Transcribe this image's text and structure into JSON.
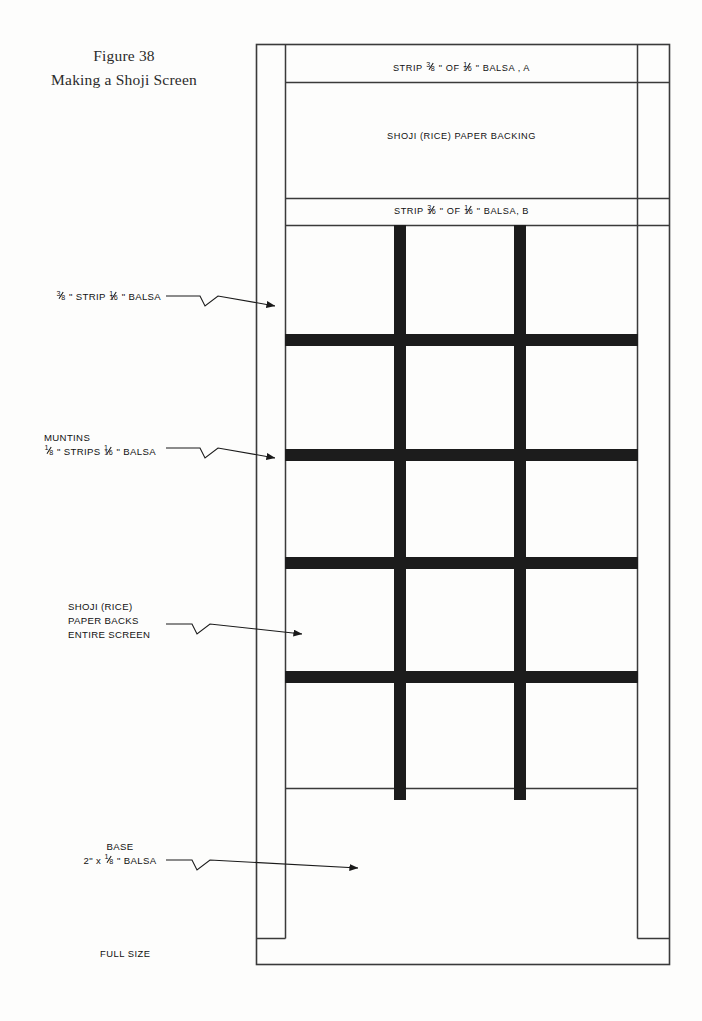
{
  "figure": {
    "title_line1": "Figure 38",
    "title_line2": "Making a Shoji Screen"
  },
  "panel_labels": {
    "top_strip": "STRIP 3/8\" OF 1/16\" BALSA , A",
    "top_strip_parts": {
      "pre": "STRIP",
      "frac1_num": "3",
      "frac1_den": "8",
      "mid": "\" OF",
      "frac2_num": "1",
      "frac2_den": "16",
      "post": "\" BALSA , A"
    },
    "paper_backing": "SHOJI (RICE) PAPER BACKING",
    "second_strip": "STRIP 3/16\" OF 1/16\" BALSA, B",
    "second_strip_parts": {
      "pre": "STRIP",
      "frac1_num": "3",
      "frac1_den": "16",
      "mid": "\" OF",
      "frac2_num": "1",
      "frac2_den": "16",
      "post": "\" BALSA, B"
    }
  },
  "callouts": [
    {
      "name": "strip-balsa",
      "lines": [
        "3/8 \" STRIP 1/16\" BALSA"
      ],
      "parts": {
        "frac1_num": "3",
        "frac1_den": "8",
        "mid": "\" STRIP",
        "frac2_num": "1",
        "frac2_den": "16",
        "post": "\" BALSA"
      }
    },
    {
      "name": "muntins",
      "line1": "MUNTINS",
      "parts": {
        "frac1_num": "1",
        "frac1_den": "8",
        "mid": "\" STRIPS",
        "frac2_num": "1",
        "frac2_den": "16",
        "post": "\" BALSA"
      }
    },
    {
      "name": "paper-backs",
      "line1": "SHOJI (RICE)",
      "line2": "PAPER BACKS",
      "line3": "ENTIRE SCREEN"
    },
    {
      "name": "base",
      "line1": "BASE",
      "parts": {
        "pre": "2\" x",
        "frac1_num": "1",
        "frac1_den": "8",
        "post": "\" BALSA"
      }
    }
  ],
  "footer": {
    "scale_note": "FULL SIZE"
  },
  "colors": {
    "ink": "#111111",
    "line": "#3a3a3a",
    "muntin": "#1c1c1c",
    "paper": "#fdfdfc"
  }
}
